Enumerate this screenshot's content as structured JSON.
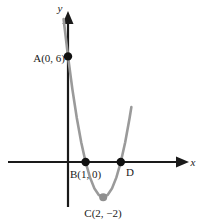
{
  "figure": {
    "kind": "coordinate-plane-parabola",
    "axis_x_label": "x",
    "axis_y_label": "y",
    "axis_color": "#1a1a1a",
    "curve_color": "#9a9a9a",
    "point_color": "#111111",
    "background": "#ffffff"
  },
  "chart_data": {
    "type": "line",
    "title": "",
    "xlabel": "x",
    "ylabel": "y",
    "grid": false,
    "legend": null,
    "xlim": [
      -1.7,
      4.4
    ],
    "ylim": [
      -3.3,
      8.6
    ],
    "curve": {
      "name": "parabola",
      "equation": "y = 2(x - 2)^2 - 2",
      "x": [
        -0.25,
        0,
        0.25,
        0.5,
        0.75,
        1,
        1.25,
        1.5,
        1.75,
        2,
        2.25,
        2.5,
        2.75,
        3,
        3.25,
        3.5,
        3.6
      ],
      "y": [
        8.125,
        6,
        4.125,
        2.5,
        1.125,
        0,
        -0.875,
        -1.5,
        -1.875,
        -2,
        -1.875,
        -1.5,
        -0.875,
        0,
        1.125,
        2.5,
        3.12
      ]
    },
    "points": [
      {
        "id": "A",
        "label": "A(0, 6)",
        "name": "A",
        "coords": "(0, 6)",
        "x": 0,
        "y": 6
      },
      {
        "id": "B",
        "label": "B(1, 0)",
        "name": "B",
        "coords": "(1, 0)",
        "x": 1,
        "y": 0
      },
      {
        "id": "C",
        "label": "C(2, −2)",
        "name": "C",
        "coords": "(2, −2)",
        "x": 2,
        "y": -2
      },
      {
        "id": "D",
        "label": "D",
        "name": "D",
        "coords": "",
        "x": 3,
        "y": 0
      }
    ]
  },
  "labels": {
    "y_axis": "y",
    "x_axis": "x",
    "A": "A(0, 6)",
    "B": "B(1, 0)",
    "C": "C(2, −2)",
    "D": "D"
  }
}
